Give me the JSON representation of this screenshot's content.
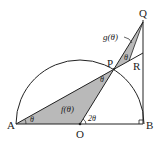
{
  "diagram": {
    "points": {
      "A": {
        "label": "A",
        "x": 16,
        "y": 124
      },
      "O": {
        "label": "O",
        "x": 80,
        "y": 124
      },
      "B": {
        "label": "B",
        "x": 143,
        "y": 124
      },
      "P": {
        "label": "P",
        "x": 114,
        "y": 69
      },
      "Q": {
        "label": "Q",
        "x": 143,
        "y": 22
      },
      "R": {
        "label": "R",
        "x": 143,
        "y": 53
      }
    },
    "angles": {
      "at_A": "θ",
      "at_P_lower": "θ",
      "at_P_upper": "θ",
      "at_Q": "",
      "at_O": "2θ"
    },
    "regions": {
      "f": "f(θ)",
      "g": "g(θ)"
    },
    "colors": {
      "stroke": "#222222",
      "shade": "#b9b9b9",
      "background": "#ffffff"
    },
    "right_angle_at": "B"
  }
}
